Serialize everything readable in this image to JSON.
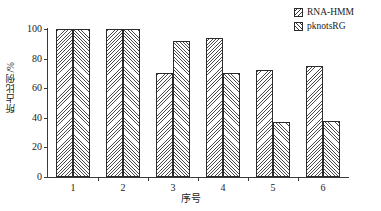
{
  "chart_data": {
    "type": "bar",
    "title": "",
    "xlabel": "序号",
    "ylabel": "所占比例/%",
    "categories": [
      "1",
      "2",
      "3",
      "4",
      "5",
      "6"
    ],
    "series": [
      {
        "name": "RNA-HMM",
        "values": [
          100,
          100,
          70,
          94,
          72,
          75
        ]
      },
      {
        "name": "pknotsRG",
        "values": [
          100,
          100,
          92,
          70,
          37,
          38
        ]
      }
    ],
    "ylim": [
      0,
      100
    ],
    "yticks": [
      0,
      20,
      40,
      60,
      80,
      100
    ],
    "ytick_labels": [
      "0",
      "20",
      "40",
      "60",
      "80",
      "100"
    ],
    "grid": false,
    "legend_position": "top-right",
    "colors": {
      "axis": "#3a3a3a",
      "bar_edge": "#2b2b2b",
      "hatch": "#4a4a4a",
      "background": "#ffffff"
    }
  },
  "legend": {
    "items": [
      {
        "label": "RNA-HMM",
        "pattern": "back-diagonal-hatch"
      },
      {
        "label": "pknotsRG",
        "pattern": "forward-diagonal-hatch"
      }
    ]
  }
}
